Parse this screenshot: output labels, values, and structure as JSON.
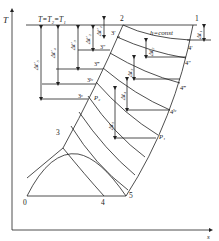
{
  "figure": {
    "type": "T-s diagram",
    "axes": {
      "y_label": "T",
      "x_label": "s"
    },
    "top_isotherm_label": "T=T₂=T₁",
    "isenthalp_label": "h=const",
    "points": {
      "p0": "0",
      "p1": "1",
      "p2": "2",
      "p3": "3",
      "p4": "4",
      "p5": "5",
      "p3_1": "3′",
      "p3_2": "3″",
      "p3_3": "3‴",
      "p3_4": "3ᴵᵛ",
      "p3_5": "3ᵛ",
      "p4_1": "4′",
      "p4_2": "4″",
      "p4_3": "4‴",
      "p4_4": "4ᴵᵛ",
      "P1": "P₁",
      "P2": "P₂"
    },
    "delta_labels": {
      "left": [
        "Δt′₁",
        "Δt′₂",
        "Δt′₃",
        "Δt′₄",
        "Δt′₅"
      ],
      "right": [
        "Δt₁",
        "Δt₂",
        "Δt₃",
        "Δt₄",
        "Δt₅"
      ]
    },
    "line_color": "#222222"
  }
}
